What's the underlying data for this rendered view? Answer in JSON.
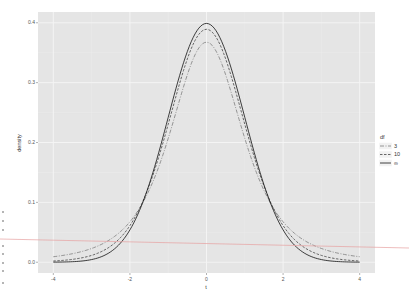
{
  "chart_data": {
    "type": "line",
    "title": "",
    "xlabel": "t",
    "ylabel": "density",
    "xlim": [
      -4.4,
      4.4
    ],
    "ylim": [
      -0.018,
      0.418
    ],
    "x_ticks": [
      -4,
      -2,
      0,
      2,
      4
    ],
    "x_tick_labels": [
      "-4",
      "-2",
      "0",
      "2",
      "4"
    ],
    "y_ticks": [
      0.0,
      0.1,
      0.2,
      0.3,
      0.4
    ],
    "y_tick_labels": [
      "0.0",
      "0.1",
      "0.2",
      "0.3",
      "0.4"
    ],
    "grid": true,
    "legend_position": "right",
    "legend_title": "df",
    "series": [
      {
        "name": "3",
        "df": 3,
        "linetype": "dotdash",
        "color": "#7f7f7f",
        "peak": 0.368
      },
      {
        "name": "10",
        "df": 10,
        "linetype": "dashed",
        "color": "#444444",
        "peak": 0.389
      },
      {
        "name": "∞",
        "df": "Inf",
        "linetype": "solid",
        "color": "#111111",
        "peak": 0.399
      }
    ],
    "x": [
      -4,
      -3.5,
      -3,
      -2.5,
      -2,
      -1.5,
      -1,
      -0.5,
      0,
      0.5,
      1,
      1.5,
      2,
      2.5,
      3,
      3.5,
      4
    ],
    "values_df3": [
      0.009,
      0.014,
      0.023,
      0.038,
      0.068,
      0.117,
      0.207,
      0.313,
      0.368,
      0.313,
      0.207,
      0.117,
      0.068,
      0.038,
      0.023,
      0.014,
      0.009
    ],
    "values_df10": [
      0.002,
      0.005,
      0.011,
      0.026,
      0.061,
      0.127,
      0.23,
      0.34,
      0.389,
      0.34,
      0.23,
      0.127,
      0.061,
      0.026,
      0.011,
      0.005,
      0.002
    ],
    "values_dfinf": [
      0.0,
      0.001,
      0.004,
      0.018,
      0.054,
      0.13,
      0.242,
      0.352,
      0.399,
      0.352,
      0.242,
      0.13,
      0.054,
      0.018,
      0.004,
      0.001,
      0.0
    ]
  },
  "axes": {
    "xlabel": "t",
    "ylabel": "density"
  },
  "legend": {
    "title": "df",
    "items": [
      {
        "label": "3",
        "dash": "4,1.5,1,1.5",
        "color": "#7f7f7f"
      },
      {
        "label": "10",
        "dash": "2.5,1.5",
        "color": "#444444"
      },
      {
        "label": "∞",
        "dash": "",
        "color": "#111111"
      }
    ]
  },
  "colors": {
    "panel_bg": "#e5e5e5",
    "grid_major": "#f5f5f5",
    "grid_minor": "#ededed",
    "annotation_line": "#e7a0a0"
  }
}
